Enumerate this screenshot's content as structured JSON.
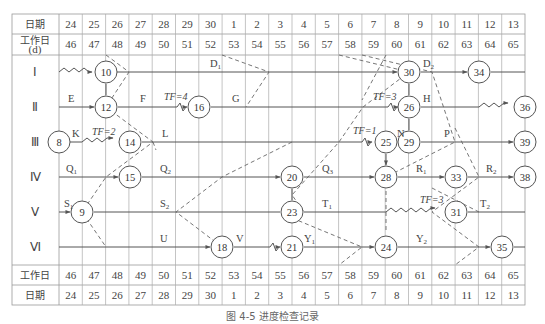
{
  "table": {
    "header_date_label": "日期",
    "header_workday_label": "工作日",
    "header_workday_unit": "(d)",
    "dates": [
      "24",
      "25",
      "26",
      "27",
      "28",
      "29",
      "30",
      "1",
      "2",
      "3",
      "4",
      "5",
      "6",
      "7",
      "8",
      "9",
      "10",
      "11",
      "12",
      "13"
    ],
    "workdays": [
      "46",
      "47",
      "48",
      "49",
      "50",
      "51",
      "52",
      "53",
      "54",
      "55",
      "56",
      "57",
      "58",
      "59",
      "60",
      "61",
      "62",
      "63",
      "64",
      "65"
    ],
    "rows": [
      "Ⅰ",
      "Ⅱ",
      "Ⅲ",
      "Ⅳ",
      "Ⅴ",
      "Ⅵ"
    ]
  },
  "activities": [
    {
      "label": "D",
      "sub": "1",
      "row": "Ⅰ"
    },
    {
      "label": "D",
      "sub": "2",
      "row": "Ⅰ"
    },
    {
      "label": "E",
      "row": "Ⅱ"
    },
    {
      "label": "F",
      "row": "Ⅱ",
      "tf": "TF=4"
    },
    {
      "label": "G",
      "row": "Ⅱ"
    },
    {
      "label": "H",
      "row": "Ⅱ",
      "tf": "TF=3"
    },
    {
      "label": "K",
      "row": "Ⅲ",
      "tf": "TF=2"
    },
    {
      "label": "L",
      "row": "Ⅲ"
    },
    {
      "label": "N",
      "row": "Ⅲ",
      "tf": "TF=1"
    },
    {
      "label": "P",
      "row": "Ⅲ"
    },
    {
      "label": "Q",
      "sub": "1",
      "row": "Ⅳ"
    },
    {
      "label": "Q",
      "sub": "2",
      "row": "Ⅳ"
    },
    {
      "label": "Q",
      "sub": "3",
      "row": "Ⅳ"
    },
    {
      "label": "R",
      "sub": "1",
      "row": "Ⅳ"
    },
    {
      "label": "R",
      "sub": "2",
      "row": "Ⅳ"
    },
    {
      "label": "S",
      "sub": "1",
      "row": "Ⅴ"
    },
    {
      "label": "S",
      "sub": "2",
      "row": "Ⅴ"
    },
    {
      "label": "T",
      "sub": "1",
      "row": "Ⅴ",
      "tf": "TF=3"
    },
    {
      "label": "T",
      "sub": "2",
      "row": "Ⅴ"
    },
    {
      "label": "U",
      "row": "Ⅵ"
    },
    {
      "label": "V",
      "row": "Ⅵ"
    },
    {
      "label": "Y",
      "sub": "1",
      "row": "Ⅵ"
    },
    {
      "label": "Y",
      "sub": "2",
      "row": "Ⅵ"
    }
  ],
  "nodes": [
    "8",
    "9",
    "10",
    "12",
    "14",
    "15",
    "16",
    "18",
    "20",
    "21",
    "23",
    "24",
    "25",
    "26",
    "28",
    "29",
    "30",
    "31",
    "33",
    "34",
    "35",
    "36",
    "38",
    "39"
  ],
  "labels": {
    "D1": "D",
    "D1s": "1",
    "D2": "D",
    "D2s": "2",
    "E": "E",
    "F": "F",
    "G": "G",
    "H": "H",
    "K": "K",
    "L": "L",
    "N": "N",
    "P": "P",
    "Q1": "Q",
    "Q1s": "1",
    "Q2": "Q",
    "Q2s": "2",
    "Q3": "Q",
    "Q3s": "3",
    "R1": "R",
    "R1s": "1",
    "R2": "R",
    "R2s": "2",
    "S1": "S",
    "S1s": "1",
    "S2": "S",
    "S2s": "2",
    "T1": "T",
    "T1s": "1",
    "T2": "T",
    "T2s": "2",
    "U": "U",
    "V": "V",
    "Y1": "Y",
    "Y1s": "1",
    "Y2": "Y",
    "Y2s": "2",
    "tf4": "TF=4",
    "tf3a": "TF=3",
    "tf2": "TF=2",
    "tf1": "TF=1",
    "tf3b": "TF=3"
  },
  "caption": "图 4-5  进度检查记录"
}
